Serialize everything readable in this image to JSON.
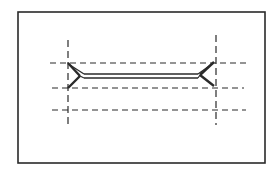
{
  "diagram": {
    "type": "line-drawing",
    "stroke_color": "#2a2a2a",
    "background_color": "#ffffff",
    "frame": {
      "x": 18,
      "y": 12,
      "width": 247,
      "height": 151
    },
    "horizontal_guides": [
      {
        "y": 63,
        "x1": 50,
        "x2": 246
      },
      {
        "y": 88,
        "x1": 52,
        "x2": 244
      },
      {
        "y": 110,
        "x1": 52,
        "x2": 246
      }
    ],
    "vertical_guides": [
      {
        "x": 68,
        "y1": 40,
        "y2": 125
      },
      {
        "x": 216,
        "y1": 35,
        "y2": 125
      }
    ],
    "bar": {
      "left_end": {
        "tip_top": [
          68,
          63
        ],
        "tip_bottom": [
          68,
          88
        ],
        "notch": [
          80,
          76
        ]
      },
      "right_end": {
        "tip_top": [
          214,
          62
        ],
        "tip_bottom": [
          214,
          86
        ],
        "notch": [
          200,
          75
        ]
      },
      "shaft": {
        "x1": 84,
        "x2": 198,
        "y_top": 74,
        "y_bottom": 78
      }
    }
  }
}
